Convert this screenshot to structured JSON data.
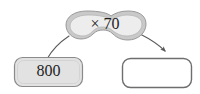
{
  "diagram": {
    "type": "function-machine",
    "background_color": "#ffffff",
    "input_box": {
      "value": "800",
      "fill_color": "#e2e2e2",
      "border_color": "#8a8a8a"
    },
    "operation_bubble": {
      "label": "× 70",
      "operator": "×",
      "operand": "70",
      "fill_color": "#ededed",
      "rim_color": "#b3b3b3",
      "border_color": "#8f8f8f",
      "shape": "cloud"
    },
    "output_box": {
      "value": "",
      "fill_color": "#ffffff",
      "border_color": "#6e6e6e"
    },
    "connectors": [
      {
        "name": "input-to-operation",
        "from": "input_box",
        "to": "operation_bubble",
        "arrowhead": false,
        "color": "#5a5a5a"
      },
      {
        "name": "operation-to-output",
        "from": "operation_bubble",
        "to": "output_box",
        "arrowhead": true,
        "color": "#5a5a5a"
      }
    ]
  }
}
